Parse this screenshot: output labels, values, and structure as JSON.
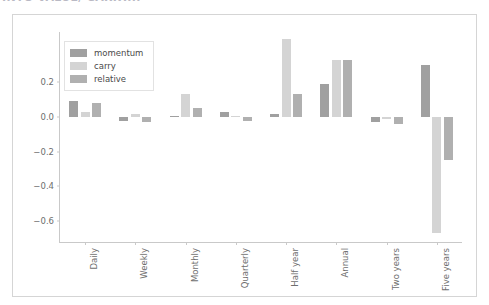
{
  "page": {
    "heading": "INTO VALUE/ CARRY..."
  },
  "chart_data": {
    "type": "bar",
    "title": "",
    "subtitle": "",
    "xlabel": "",
    "ylabel": "",
    "grid": false,
    "legend_position": "upper-left",
    "categories": [
      "Daily",
      "Weekly",
      "Monthly",
      "Quarterly",
      "Half year",
      "Annual",
      "Two years",
      "Five years"
    ],
    "series": [
      {
        "name": "momentum",
        "color": "#a0a0a0",
        "values": [
          0.09,
          -0.02,
          0.005,
          0.03,
          0.02,
          0.19,
          -0.03,
          0.3
        ]
      },
      {
        "name": "carry",
        "color": "#d4d4d4",
        "values": [
          0.03,
          0.02,
          0.13,
          0.005,
          0.45,
          0.33,
          -0.01,
          -0.67
        ]
      },
      {
        "name": "relative",
        "color": "#b0b0b0",
        "values": [
          0.08,
          -0.03,
          0.05,
          -0.02,
          0.13,
          0.33,
          -0.04,
          -0.25
        ]
      }
    ],
    "yticks": [
      0.2,
      0.0,
      -0.2,
      -0.4,
      -0.6
    ],
    "ytick_labels": [
      "0.2",
      "0.0",
      "−0.2",
      "−0.4",
      "−0.6"
    ],
    "ylim": [
      -0.72,
      0.49
    ],
    "axis_color": "#c9c9c9",
    "panel_border_color": "#d5d5d5"
  }
}
